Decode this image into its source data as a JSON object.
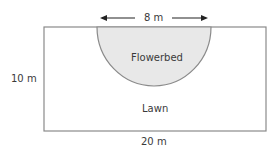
{
  "diagram": {
    "type": "geometry-area",
    "shapes": [
      {
        "kind": "rectangle",
        "name": "Lawn",
        "width": "20 m",
        "height": "10 m"
      },
      {
        "kind": "semicircle",
        "name": "Flowerbed",
        "diameter": "8 m"
      }
    ],
    "labels": {
      "top_dimension": "8 m",
      "left_dimension": "10 m",
      "bottom_dimension": "20 m",
      "flowerbed": "Flowerbed",
      "lawn": "Lawn"
    },
    "colors": {
      "outline": "#8a8a8a",
      "flowerbed_fill": "#e8e8e8",
      "arrow": "#222222",
      "background": "#ffffff"
    }
  }
}
